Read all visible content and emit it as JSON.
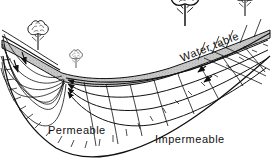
{
  "figure": {
    "background_color": "#ffffff",
    "ink_color": "#111111",
    "water_table_band_color": "#c8c8c8",
    "width": 272,
    "height": 165
  },
  "labels": {
    "water_table": "Water table",
    "permeable": "Permeable",
    "impermeable": "Impermeable"
  },
  "label_placement": {
    "water_table": {
      "x": 182,
      "y": 62,
      "rotation": -22,
      "font_size": 11
    },
    "permeable": {
      "x": 48,
      "y": 134,
      "rotation": 0,
      "font_size": 11
    },
    "impermeable": {
      "x": 155,
      "y": 143,
      "rotation": 0,
      "font_size": 11
    }
  },
  "scene_elements": {
    "trees": [
      {
        "name": "tree-left-bank",
        "x": 38,
        "y": 50,
        "scale": 1.0
      },
      {
        "name": "tree-valley-small",
        "x": 76,
        "y": 68,
        "scale": 0.62
      },
      {
        "name": "tree-center-large",
        "x": 185,
        "y": 26,
        "scale": 1.35
      },
      {
        "name": "tree-right-upper",
        "x": 245,
        "y": 16,
        "scale": 1.0
      }
    ],
    "water_table_label_follows_slope": true,
    "flow_arrow_direction": "toward valley (leftward and downward)",
    "flow_arrow_count": 9,
    "hatching_marks_on": "impermeable boundary",
    "flow_net_cells_on": "right recharge slope"
  },
  "legend_notes": {
    "permeable_zone": "Permeable",
    "impermeable_zone": "Impermeable",
    "surface": "Water table"
  }
}
